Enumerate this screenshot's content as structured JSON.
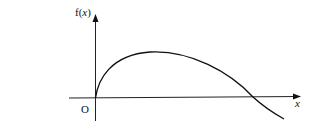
{
  "diagram": {
    "y_axis_label": "f(x)",
    "y_label_f": "f(",
    "y_label_x": "x",
    "y_label_close": ")",
    "x_axis_label": "x",
    "origin_label": "O",
    "curve_description": "f(x) rises steeply from origin, reaches a maximum, then decreases and crosses the positive x-axis, continuing below",
    "line_color": "#111111"
  }
}
